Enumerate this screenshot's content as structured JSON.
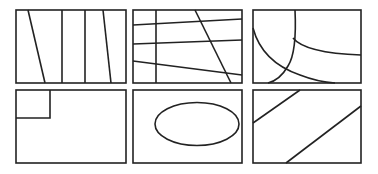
{
  "figure": {
    "width": 378,
    "height": 174,
    "background": "#ffffff",
    "stroke_color": "#222222",
    "stroke_width": 1.6,
    "panels": [
      {
        "id": "p1",
        "name": "panel-vertical-partitions",
        "x": 16,
        "y": 10,
        "w": 110,
        "h": 73,
        "description": "Rectangle divided by four near-vertical lines"
      },
      {
        "id": "p2",
        "name": "panel-grid-crossing-lines",
        "x": 133,
        "y": 10,
        "w": 109,
        "h": 73,
        "description": "Rectangle crossed by three near-horizontal lines, one vertical and one diagonal line"
      },
      {
        "id": "p3",
        "name": "panel-curved-partitions",
        "x": 253,
        "y": 10,
        "w": 108,
        "h": 73,
        "description": "Rectangle divided by curved arcs"
      },
      {
        "id": "p4",
        "name": "panel-corner-subrectangle",
        "x": 16,
        "y": 90,
        "w": 110,
        "h": 73,
        "description": "Rectangle with small rectangle in upper-left corner"
      },
      {
        "id": "p5",
        "name": "panel-ellipse",
        "x": 133,
        "y": 90,
        "w": 109,
        "h": 73,
        "description": "Rectangle containing an ellipse"
      },
      {
        "id": "p6",
        "name": "panel-diagonal-bands",
        "x": 253,
        "y": 90,
        "w": 108,
        "h": 73,
        "description": "Rectangle crossed by two parallel diagonal lines"
      }
    ]
  }
}
